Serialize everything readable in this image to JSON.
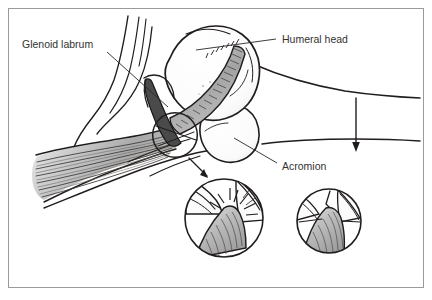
{
  "figure": {
    "kind": "anatomical-illustration",
    "background_color": "#ffffff",
    "frame": {
      "border_color": "#9a9a9a",
      "border_width_px": 1,
      "x": 8,
      "y": 8,
      "width": 416,
      "height": 280
    },
    "ink_color": "#201d1c",
    "muscle_fill": "#b9b9b9",
    "bone_fill": "#ffffff",
    "labrum_fill": "#4a4a4a",
    "tendon_fill": "#a8a8a8"
  },
  "labels": [
    {
      "id": "glenoid-labrum",
      "text": "Glenoid labrum",
      "x": 22,
      "y": 48,
      "anchor": "start",
      "leader_from": [
        107,
        52
      ],
      "leader_to": [
        168,
        107
      ]
    },
    {
      "id": "humeral-head",
      "text": "Humeral head",
      "x": 282,
      "y": 43,
      "anchor": "start",
      "leader_from": [
        276,
        39
      ],
      "leader_to": [
        196,
        50
      ]
    },
    {
      "id": "acromion",
      "text": "Acromion",
      "x": 282,
      "y": 170,
      "anchor": "start",
      "leader_from": [
        277,
        163
      ],
      "leader_to": [
        234,
        138
      ]
    }
  ],
  "annotations": {
    "force_arrow": {
      "id": "downward-force-arrow",
      "direction": "down",
      "x": 356,
      "y_start": 98,
      "y_end": 150
    },
    "callout_arrow": {
      "id": "callout-arrow-to-inset",
      "from": [
        189,
        158
      ],
      "to": [
        209,
        178
      ]
    }
  },
  "insets": [
    {
      "id": "impingement-inset",
      "cx": 224,
      "cy": 218,
      "r": 40,
      "shows_pain_burst": true,
      "description": "Tendon compressed under acromion with radiating burst lines"
    },
    {
      "id": "normal-inset",
      "cx": 329,
      "cy": 221,
      "r": 33,
      "shows_pain_burst": false,
      "description": "Tendon passing beneath acromion without compression"
    }
  ],
  "magnifier": {
    "id": "primary-detail-circle",
    "cx": 175,
    "cy": 135,
    "r": 23
  }
}
